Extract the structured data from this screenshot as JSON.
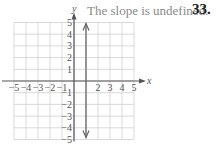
{
  "caption": "The slope is undefined.",
  "problem_number": "33.",
  "chart_data": {
    "type": "line",
    "title": "The slope is undefined.",
    "xlabel": "x",
    "ylabel": "y",
    "xlim": [
      -5,
      5
    ],
    "ylim": [
      -5,
      5
    ],
    "grid": true,
    "x_ticks": [
      "-5",
      "-4",
      "-3",
      "-2",
      "-1",
      "2",
      "3",
      "4",
      "5"
    ],
    "y_ticks": [
      "5",
      "4",
      "3",
      "2",
      "1",
      "-1",
      "-2",
      "-3",
      "-4",
      "-5"
    ],
    "series": [
      {
        "name": "x = 1",
        "description": "vertical line with arrows at both ends",
        "x": [
          1,
          1
        ],
        "y": [
          -5,
          5
        ]
      }
    ]
  },
  "colors": {
    "grid": "#d9d9d9",
    "axis": "#555555",
    "line": "#666666",
    "caption": "#8a8a8a"
  }
}
